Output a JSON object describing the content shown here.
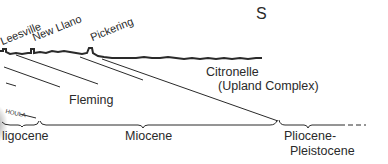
{
  "diagram": {
    "direction_label": "S",
    "towns": [
      {
        "name": "Leesville"
      },
      {
        "name": "New Llano"
      },
      {
        "name": "Pickering"
      }
    ],
    "formations": {
      "fleming": "Fleming",
      "citronelle_line1": "Citronelle",
      "citronelle_line2": "(Upland Complex)",
      "catahoula_fragment": "HOULA"
    },
    "epochs": [
      {
        "name": "Oligocene",
        "display": "ligocene"
      },
      {
        "name": "Miocene",
        "display": "Miocene"
      },
      {
        "name": "Pliocene-Pleistocene",
        "line1": "Pliocene-",
        "line2": "Pleistocene"
      }
    ],
    "colors": {
      "ink": "#2a2a2a",
      "background": "#ffffff"
    }
  }
}
